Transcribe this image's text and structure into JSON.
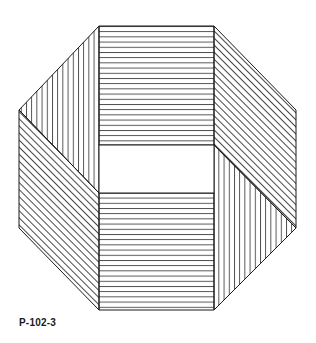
{
  "figure": {
    "label": "P-102-3",
    "line_color": "#1a1a1a",
    "background": "#ffffff",
    "shape": "octagon-ribbon",
    "panels": [
      {
        "name": "top-rect",
        "hatch": "horizontal"
      },
      {
        "name": "bottom-rect",
        "hatch": "horizontal"
      },
      {
        "name": "upper-left",
        "hatch": "vertical"
      },
      {
        "name": "lower-left",
        "hatch": "diagonal"
      },
      {
        "name": "upper-right",
        "hatch": "diagonal"
      },
      {
        "name": "lower-right",
        "hatch": "vertical"
      },
      {
        "name": "center-window",
        "hatch": "none"
      }
    ]
  }
}
